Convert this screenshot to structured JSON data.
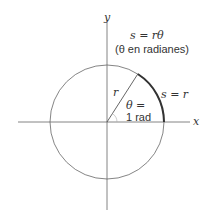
{
  "diagram": {
    "axes": {
      "x_label": "x",
      "y_label": "y"
    },
    "formula": {
      "line1": "s = rθ",
      "line2": "(θ en radianes)"
    },
    "radius_label": "r",
    "arc_label": "s = r",
    "angle_label": {
      "line1": "θ =",
      "line2": "1 rad"
    },
    "colors": {
      "stroke": "#555555",
      "arc": "#333333",
      "text": "#333333"
    }
  }
}
